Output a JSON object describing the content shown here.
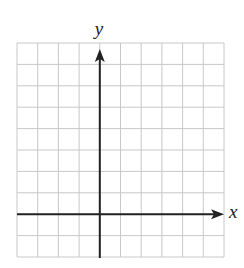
{
  "diagram": {
    "type": "coordinate-plane",
    "grid": {
      "columns": 10,
      "rows": 10,
      "left": 17,
      "top": 43,
      "width": 207,
      "height": 214,
      "line_color": "#c8c8c8"
    },
    "axes": {
      "color": "#222222",
      "y_axis_column": 4,
      "x_axis_row": 8,
      "x_label": "x",
      "y_label": "y"
    }
  }
}
